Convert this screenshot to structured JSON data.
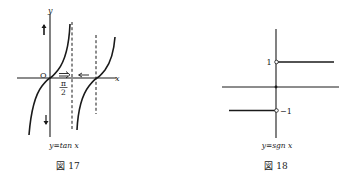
{
  "figures": [
    {
      "id": "fig17",
      "function_label": "y=tan x",
      "caption": "図 17",
      "axis_labels": {
        "x": "x",
        "y": "y",
        "origin": "O"
      },
      "tick_label": {
        "numerator": "π",
        "denominator": "2"
      },
      "annotations": {
        "right_arrow": "⇒",
        "left_arrow": "←",
        "up_arrow": "↑",
        "down_arrow": "↓"
      }
    },
    {
      "id": "fig18",
      "function_label": "y=sgn x",
      "caption": "図 18",
      "tick_labels": {
        "pos": "1",
        "neg": "−1"
      }
    }
  ],
  "colors": {
    "ink": "#1a1a1a",
    "background": "#ffffff"
  }
}
